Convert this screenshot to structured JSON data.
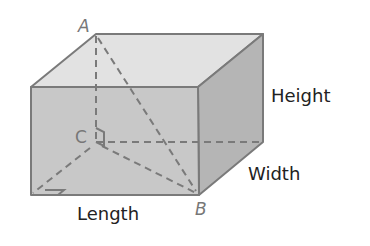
{
  "diagram": {
    "type": "rectangular-prism",
    "points": {
      "A": "A",
      "B": "B",
      "C": "C"
    },
    "dimension_labels": {
      "height": "Height",
      "width": "Width",
      "length": "Length"
    },
    "colors": {
      "front_face": "#c8c8c8",
      "top_face": "#e2e2e2",
      "side_face": "#b5b5b5",
      "edge": "#7a7a7a",
      "hidden_edge": "#7a7a7a",
      "label_text": "#222222",
      "point_text": "#777777"
    },
    "annotations": [
      "right-angle marker at C",
      "right-angle marker at bottom-left front"
    ]
  }
}
